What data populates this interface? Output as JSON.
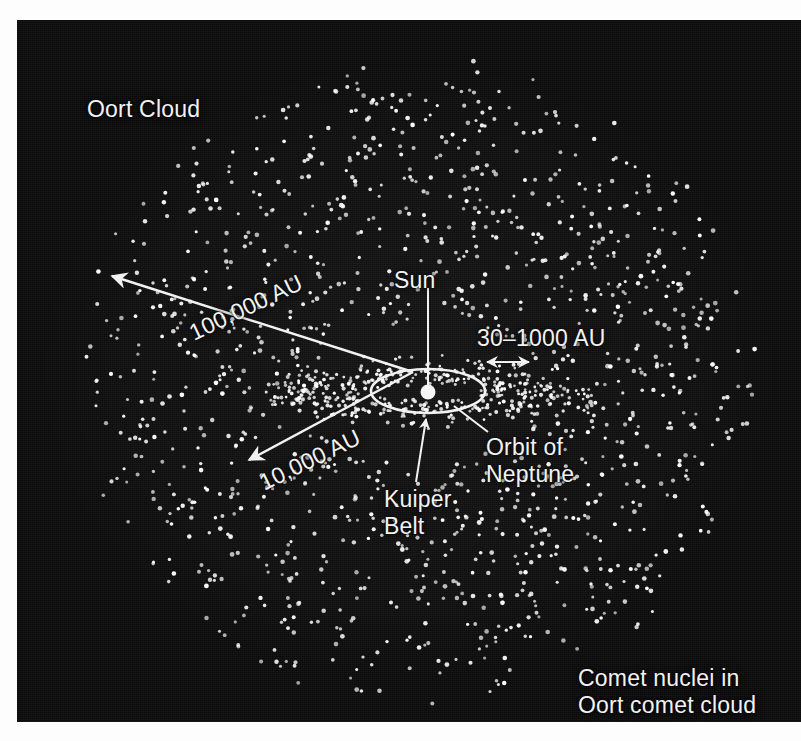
{
  "figure": {
    "background_color": "#0a0a0a",
    "ink_color": "#f2f2f2",
    "panel": {
      "x": 17,
      "y": 20,
      "width": 784,
      "height": 702
    }
  },
  "labels": {
    "oort_cloud": "Oort Cloud",
    "sun": "Sun",
    "distance_outer": "100,000 AU",
    "distance_inner": "10,000 AU",
    "distance_kuiper": "30–1000 AU",
    "kuiper_belt": "Kuiper\nBelt",
    "orbit_of_neptune": "Orbit of\nNeptune",
    "caption": "Comet nuclei in\nOort comet cloud"
  },
  "chart_data": {
    "type": "scatter",
    "xlabel": "",
    "ylabel": "",
    "grid": false,
    "legend": "none",
    "annotations": [
      {
        "name": "oort-cloud-label",
        "text": "Oort Cloud",
        "x": 70,
        "y": 76
      },
      {
        "name": "sun-label",
        "text": "Sun",
        "x": 377,
        "y": 247
      },
      {
        "name": "outer-radius-label",
        "text": "100,000 AU",
        "x": 168,
        "y": 302,
        "rotation": -25.5
      },
      {
        "name": "inner-radius-label",
        "text": "10,000 AU",
        "x": 238,
        "y": 452,
        "rotation": -26
      },
      {
        "name": "kuiper-extent-label",
        "text": "30–1000 AU",
        "x": 460,
        "y": 305
      },
      {
        "name": "kuiper-belt-label",
        "text": "Kuiper Belt",
        "x": 367,
        "y": 466
      },
      {
        "name": "neptune-orbit-label",
        "text": "Orbit of Neptune",
        "x": 469,
        "y": 414
      },
      {
        "name": "caption",
        "text": "Comet nuclei in Oort comet cloud",
        "x": 561,
        "y": 645
      }
    ],
    "scales": [
      {
        "name": "Oort cloud outer radius",
        "value": 100000,
        "unit": "AU",
        "arrow": "single",
        "from": [
          396,
          352
        ],
        "to": [
          95,
          256
        ]
      },
      {
        "name": "Oort cloud inner radius",
        "value": 10000,
        "unit": "AU",
        "arrow": "single",
        "from": [
          396,
          352
        ],
        "to": [
          232,
          440
        ]
      },
      {
        "name": "Kuiper belt extent",
        "value_min": 30,
        "value_max": 1000,
        "unit": "AU",
        "arrow": "double",
        "from": [
          468,
          342
        ],
        "to": [
          513,
          342
        ]
      }
    ],
    "objects": [
      {
        "name": "sun",
        "kind": "point",
        "cx": 411,
        "cy": 372,
        "r": 7,
        "color": "#f2f2f2"
      },
      {
        "name": "neptune-orbit",
        "kind": "ellipse",
        "cx": 411,
        "cy": 371,
        "rx": 57,
        "ry": 22,
        "color": "#f2f2f2"
      },
      {
        "name": "kuiper-belt",
        "kind": "dot-disc",
        "cx": 411,
        "cy": 372,
        "rx": 165,
        "ry": 34,
        "count": 420
      },
      {
        "name": "oort-cloud",
        "kind": "dot-sphere",
        "cx": 400,
        "cy": 360,
        "rx": 340,
        "ry": 325,
        "count": 1500
      }
    ],
    "leaders": [
      {
        "name": "sun-leader",
        "from": [
          411,
          268
        ],
        "to": [
          411,
          366
        ]
      },
      {
        "name": "kuiper-leader",
        "from": [
          399,
          462
        ],
        "to": [
          409,
          397
        ],
        "arrow": true
      },
      {
        "name": "neptune-leader",
        "from": [
          471,
          412
        ],
        "to": [
          437,
          386
        ]
      }
    ]
  }
}
